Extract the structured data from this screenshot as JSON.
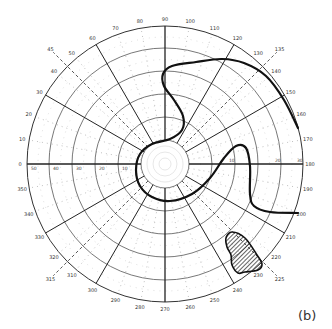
{
  "diagram": {
    "type": "polar visual field chart (perimetry)",
    "panel_label": "(b)",
    "center": [
      165,
      164
    ],
    "outer_radius": 138,
    "ring_radii": [
      24,
      47,
      70,
      93,
      116,
      138
    ],
    "ring_labels_left": [
      "10",
      "20",
      "30",
      "40",
      "50"
    ],
    "ring_labels_right": [
      "10",
      "20",
      "30"
    ],
    "angle_labels": [
      "0",
      "10",
      "20",
      "30",
      "40",
      "50",
      "60",
      "70",
      "80",
      "90",
      "100",
      "110",
      "120",
      "130",
      "140",
      "150",
      "160",
      "170",
      "180",
      "190",
      "200",
      "210",
      "220",
      "230",
      "240",
      "250",
      "260",
      "270",
      "280",
      "290",
      "300",
      "310",
      "320",
      "330",
      "340",
      "350"
    ],
    "meridians_solid_deg": [
      0,
      30,
      60,
      90,
      120,
      150,
      180,
      210,
      240,
      270,
      300,
      330
    ],
    "meridians_dashed_deg": [
      45,
      135,
      225,
      315
    ],
    "dashed_labels": [
      "45",
      "135",
      "225",
      "315"
    ],
    "isopter": {
      "label": "isopter boundary",
      "color": "#111111",
      "points": [
        [
          298,
          128
        ],
        [
          284,
          100
        ],
        [
          266,
          76
        ],
        [
          244,
          63
        ],
        [
          222,
          59
        ],
        [
          196,
          62
        ],
        [
          172,
          66
        ],
        [
          163,
          74
        ],
        [
          164,
          86
        ],
        [
          174,
          100
        ],
        [
          183,
          116
        ],
        [
          182,
          130
        ],
        [
          170,
          139
        ],
        [
          152,
          144
        ],
        [
          140,
          154
        ],
        [
          136,
          170
        ],
        [
          140,
          186
        ],
        [
          152,
          197
        ],
        [
          170,
          201
        ],
        [
          192,
          194
        ],
        [
          210,
          178
        ],
        [
          224,
          158
        ],
        [
          236,
          146
        ],
        [
          246,
          148
        ],
        [
          250,
          166
        ],
        [
          250,
          194
        ],
        [
          254,
          206
        ],
        [
          270,
          212
        ],
        [
          298,
          213
        ]
      ]
    },
    "scotoma": {
      "label": "hatched scotoma",
      "points": [
        [
          232,
          232
        ],
        [
          245,
          238
        ],
        [
          257,
          255
        ],
        [
          262,
          264
        ],
        [
          258,
          270
        ],
        [
          245,
          272
        ],
        [
          238,
          273
        ],
        [
          232,
          265
        ],
        [
          231,
          255
        ],
        [
          227,
          247
        ],
        [
          226,
          238
        ]
      ]
    },
    "colors": {
      "line": "#222222",
      "grid_dotted": "#aaaaaa",
      "background": "#ffffff"
    }
  }
}
